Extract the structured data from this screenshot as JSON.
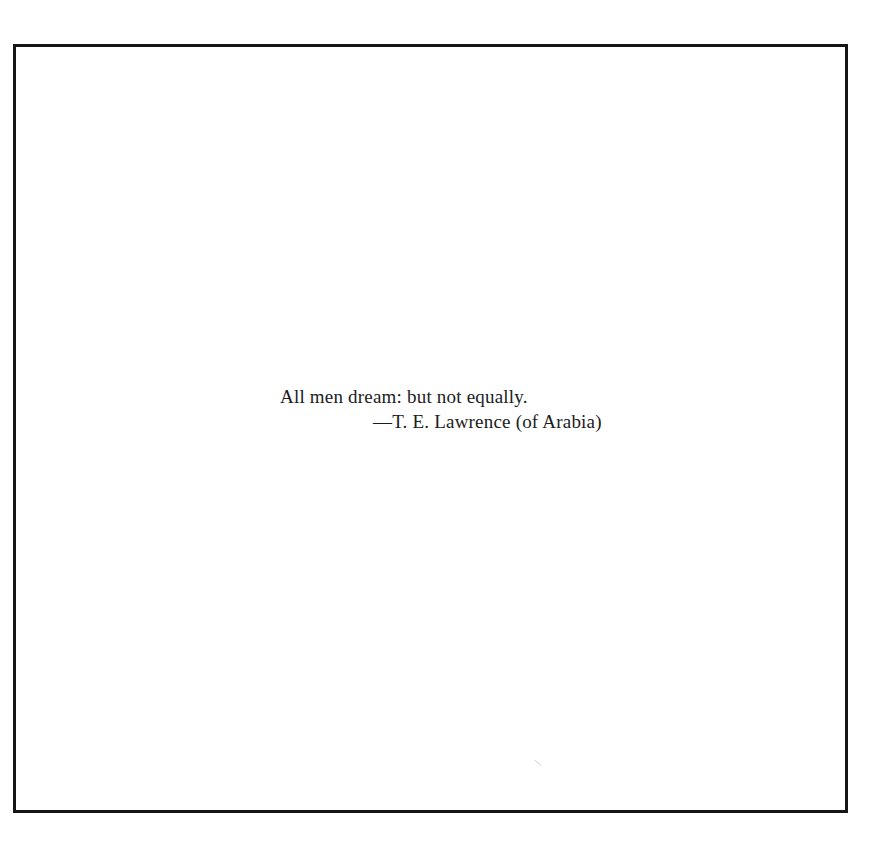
{
  "page": {
    "epigraph": {
      "quote_line": "All men dream: but not equally.",
      "attribution_line": "—T. E. Lawrence (of Arabia)"
    },
    "colors": {
      "frame_border": "#161616",
      "text": "#1c1c1c",
      "background": "#ffffff"
    }
  }
}
